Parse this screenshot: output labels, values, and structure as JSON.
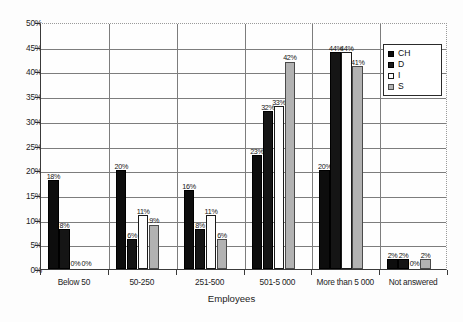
{
  "chart_data": {
    "type": "bar",
    "title": "",
    "xlabel": "Employees",
    "ylabel": "",
    "ylim": [
      0,
      50
    ],
    "ytick_labels": [
      "0%",
      "5%",
      "10%",
      "15%",
      "20%",
      "25%",
      "30%",
      "35%",
      "40%",
      "45%",
      "50%"
    ],
    "ytick_values": [
      0,
      5,
      10,
      15,
      20,
      25,
      30,
      35,
      40,
      45,
      50
    ],
    "grid": true,
    "legend_position": "top-right",
    "categories": [
      "Below 50",
      "50-250",
      "251-500",
      "501-5 000",
      "More than 5 000",
      "Not answered"
    ],
    "series": [
      {
        "name": "CH",
        "color": "#0d0d0d",
        "values": [
          18,
          20,
          16,
          23,
          20,
          2
        ],
        "labels": [
          "18%",
          "20%",
          "16%",
          "23%",
          "20%",
          "2%"
        ]
      },
      {
        "name": "D",
        "color": "#151515",
        "values": [
          8,
          6,
          8,
          32,
          44,
          2
        ],
        "labels": [
          "8%",
          "6%",
          "8%",
          "32%",
          "44%",
          "2%"
        ]
      },
      {
        "name": "I",
        "color": "#fdfdfd",
        "values": [
          0,
          11,
          11,
          33,
          44,
          0
        ],
        "labels": [
          "0%",
          "11%",
          "11%",
          "33%",
          "44%",
          "0%"
        ]
      },
      {
        "name": "S",
        "color": "#b2b2b2",
        "values": [
          0,
          9,
          6,
          42,
          41,
          2
        ],
        "labels": [
          "0%",
          "9%",
          "6%",
          "42%",
          "41%",
          "2%"
        ]
      }
    ]
  },
  "legend": {
    "items": [
      {
        "label": "CH",
        "swatch": "swatch-black-solid"
      },
      {
        "label": "D",
        "swatch": "swatch-black-dotted"
      },
      {
        "label": "I",
        "swatch": "swatch-white-outline"
      },
      {
        "label": "S",
        "swatch": "swatch-gray-solid"
      }
    ]
  }
}
